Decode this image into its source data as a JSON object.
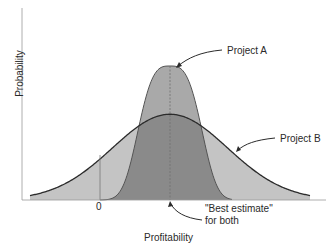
{
  "chart_data": {
    "type": "area",
    "title": "",
    "xlabel": "Profitability",
    "ylabel": "Probability",
    "x_ticks": [
      {
        "value": 0,
        "label": "0"
      }
    ],
    "grid": false,
    "legend": "none (direct annotations)",
    "x": [
      -4,
      -3.5,
      -3,
      -2.5,
      -2,
      -1.5,
      -1,
      -0.5,
      0,
      0.5,
      1,
      1.5,
      2,
      2.5,
      3,
      3.5,
      4
    ],
    "series": [
      {
        "name": "Project A",
        "description": "Narrow distribution, high peak, truncated tails",
        "mean": 0,
        "stdev": 0.75,
        "relative_peak": 1.0,
        "values": [
          0,
          0,
          0,
          0,
          0.03,
          0.14,
          0.41,
          0.8,
          1.0,
          0.8,
          0.41,
          0.14,
          0.03,
          0,
          0,
          0,
          0
        ]
      },
      {
        "name": "Project B",
        "description": "Wide distribution, lower peak",
        "mean": 0,
        "stdev": 1.6,
        "relative_peak": 0.64,
        "values": [
          0.03,
          0.06,
          0.11,
          0.19,
          0.29,
          0.4,
          0.51,
          0.61,
          0.64,
          0.61,
          0.51,
          0.4,
          0.29,
          0.19,
          0.11,
          0.06,
          0.03
        ]
      }
    ],
    "annotations": [
      {
        "text": "Project A",
        "points_to": "peak of Project A curve"
      },
      {
        "text": "Project B",
        "points_to": "right slope of Project B curve"
      },
      {
        "text": "\"Best estimate\"",
        "text2": "for both",
        "points_to": "common mean on x-axis"
      }
    ],
    "zero_marker": "vertical line at profitability 0, left of the mean"
  },
  "labels": {
    "project_a": "Project A",
    "project_b": "Project B",
    "best_estimate_line1": "\"Best estimate\"",
    "best_estimate_line2": "for both",
    "zero": "0",
    "xlabel": "Profitability",
    "ylabel": "Probability"
  },
  "colors": {
    "light_fill": "#c4c4c4",
    "mid_fill": "#a9a9a9",
    "dark_fill": "#8a8a8a",
    "curve_stroke": "#2b2b2b",
    "axis": "#9a9a9a"
  }
}
